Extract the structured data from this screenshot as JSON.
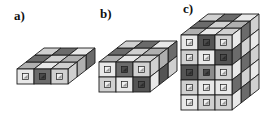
{
  "figure": {
    "background_color": "#ffffff",
    "stroke_color": "#1a1a1a",
    "caption_color": "#111111"
  },
  "palette": {
    "light": "#e8e8e8",
    "mid_light": "#d0d0d0",
    "mid": "#b0b0b0",
    "mid_dark": "#8c8c8c",
    "dark": "#6b6b6b",
    "darker": "#545454",
    "marker_light": "#efefef",
    "marker_dark": "#4a4a4a",
    "outline": "#1a1a1a"
  },
  "panels": [
    {
      "id": "a",
      "label": "a)",
      "label_x": 14,
      "label_y": 9,
      "origin_x": 16,
      "origin_y": 46,
      "cols": 3,
      "rows": 1,
      "depth": 3,
      "front_shades": [
        [
          "light",
          "dark",
          "mid_light"
        ]
      ],
      "top_shades": [
        [
          "mid_light",
          "dark",
          "light"
        ],
        [
          "dark",
          "mid_light",
          "mid"
        ],
        [
          "mid",
          "light",
          "mid_light"
        ]
      ],
      "side_shades": [
        [
          "dark",
          "mid",
          "mid_light"
        ]
      ]
    },
    {
      "id": "b",
      "label": "b)",
      "label_x": 100,
      "label_y": 7,
      "origin_x": 98,
      "origin_y": 39,
      "cols": 3,
      "rows": 2,
      "depth": 3,
      "front_shades": [
        [
          "light",
          "dark",
          "mid_light"
        ],
        [
          "mid_light",
          "light",
          "darker"
        ]
      ],
      "top_shades": [
        [
          "mid_light",
          "dark",
          "light"
        ],
        [
          "dark",
          "mid_light",
          "mid"
        ],
        [
          "mid",
          "light",
          "mid_light"
        ]
      ],
      "side_shades": [
        [
          "dark",
          "mid",
          "mid_light"
        ],
        [
          "mid_light",
          "darker",
          "light"
        ]
      ]
    },
    {
      "id": "c",
      "label": "c)",
      "label_x": 183,
      "label_y": 2,
      "origin_x": 180,
      "origin_y": 12,
      "cols": 3,
      "rows": 5,
      "depth": 3,
      "front_shades": [
        [
          "light",
          "darker",
          "mid_light"
        ],
        [
          "mid_light",
          "light",
          "darker"
        ],
        [
          "darker",
          "mid_dark",
          "mid_light"
        ],
        [
          "mid_light",
          "light",
          "light"
        ],
        [
          "light",
          "mid_light",
          "mid_light"
        ]
      ],
      "top_shades": [
        [
          "mid_light",
          "dark",
          "light"
        ],
        [
          "dark",
          "mid_light",
          "mid"
        ],
        [
          "mid",
          "light",
          "mid_light"
        ]
      ],
      "side_shades": [
        [
          "mid_light",
          "dark",
          "light"
        ],
        [
          "light",
          "mid_light",
          "dark"
        ],
        [
          "mid_light",
          "dark",
          "light"
        ],
        [
          "light",
          "mid_light",
          "dark"
        ],
        [
          "mid_light",
          "dark",
          "light"
        ]
      ]
    }
  ],
  "geometry": {
    "cube_width": 17,
    "cube_height": 15,
    "iso_dx": 9,
    "iso_dy": -7,
    "marker_size": 6
  }
}
